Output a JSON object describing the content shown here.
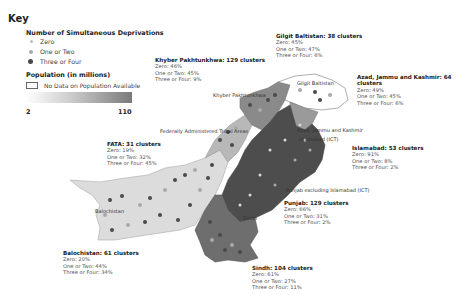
{
  "key": {
    "title": "Key",
    "deprivations_heading": "Number of Simultaneous Deprivations",
    "deprivation_items": [
      {
        "label": "Zero",
        "color": "#d8d8d8"
      },
      {
        "label": "One or Two",
        "color": "#a9a9a9"
      },
      {
        "label": "Three or Four",
        "color": "#4a4a4a"
      }
    ],
    "population_heading": "Population (in millions)",
    "no_data_label": "No Data on Population Available",
    "gradient_min": "2",
    "gradient_max": "110"
  },
  "regions": [
    {
      "id": "khyber",
      "title": "Khyber Pakhtunkhwa: 129 clusters",
      "zero": "Zero: 46%",
      "one_two": "One or Two: 45%",
      "three_four": "Three or Four: 9%"
    },
    {
      "id": "gilgit",
      "title": "Gilgit Baltistan: 38 clusters",
      "zero": "Zero: 45%",
      "one_two": "One or Two: 47%",
      "three_four": "Three or Four: 6%"
    },
    {
      "id": "ajk",
      "title": "Azad, Jammu and Kashmir: 64",
      "title2": "clusters",
      "zero": "Zero: 49%",
      "one_two": "One or Two: 45%",
      "three_four": "Three or Four: 6%"
    },
    {
      "id": "islamabad",
      "title": "Islamabad: 53 clusters",
      "zero": "Zero: 91%",
      "one_two": "One or Two: 8%",
      "three_four": "Three or Four: 2%"
    },
    {
      "id": "fata",
      "title": "FATA: 31 clusters",
      "zero": "Zero: 19%",
      "one_two": "One or Two: 32%",
      "three_four": "Three or Four: 45%"
    },
    {
      "id": "punjab",
      "title": "Punjab: 129 clusters",
      "zero": "Zero: 66%",
      "one_two": "One or Two: 31%",
      "three_four": "Three or Four: 2%"
    },
    {
      "id": "sindh",
      "title": "Sindh: 104 clusters",
      "zero": "Zero: 61%",
      "one_two": "One or Two: 27%",
      "three_four": "Three or Four: 11%"
    },
    {
      "id": "balochistan",
      "title": "Balochistan: 61 clusters",
      "zero": "Zero: 20%",
      "one_two": "One or Two: 44%",
      "three_four": "Three or Four: 34%"
    }
  ],
  "map_labels": {
    "khyber": "Khyber Pakhtunkhwa",
    "gilgit": "Gilgit Baltistan",
    "fata": "Federally Administered Tribal Areas",
    "ajk": "Azad, Jammu and Kashmir",
    "islamabad": "Islamabad (ICT)",
    "punjab": "Punjab excluding Islamabad (ICT)",
    "balochistan": "Balochistan",
    "sindh": "Sindh"
  },
  "colors": {
    "punjab_fill": "#4d4d4d",
    "sindh_fill": "#6e6e6e",
    "khyber_fill": "#8a8a8a",
    "fata_fill": "#b8b8b8",
    "balochistan_fill": "#dcdcdc",
    "gilgit_fill": "#ffffff"
  }
}
